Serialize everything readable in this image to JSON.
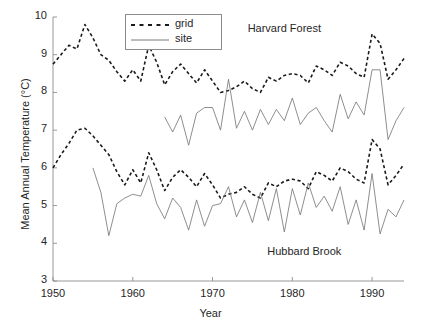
{
  "chart_data": {
    "type": "line",
    "title": "",
    "xlabel": "Year",
    "ylabel": "Mean Annual Temperature (°C)",
    "xlim": [
      1950,
      1994
    ],
    "ylim": [
      3,
      10
    ],
    "xticks": [
      1950,
      1960,
      1970,
      1980,
      1990
    ],
    "xtick_labels": [
      "1950",
      "1960",
      "1970",
      "1980",
      "1990"
    ],
    "yticks": [
      3,
      4,
      5,
      6,
      7,
      8,
      9,
      10
    ],
    "ytick_labels": [
      "3",
      "4",
      "5",
      "6",
      "7",
      "8",
      "9",
      "10"
    ],
    "grid": false,
    "legend": {
      "position": "top-center",
      "entries": [
        {
          "name": "grid",
          "style": "dashed",
          "color": "#1a1a1a"
        },
        {
          "name": "site",
          "style": "solid",
          "color": "#7a7a7a"
        }
      ]
    },
    "annotations": [
      {
        "text": "Harvard Forest",
        "x": 1979,
        "y": 9.65
      },
      {
        "text": "Hubbard Brook",
        "x": 1981.5,
        "y": 3.75
      }
    ],
    "series": [
      {
        "name": "Harvard Forest grid",
        "station": "Harvard Forest",
        "kind": "grid",
        "style": "dashed",
        "color": "#1a1a1a",
        "x": [
          1950,
          1951,
          1952,
          1953,
          1954,
          1955,
          1956,
          1957,
          1958,
          1959,
          1960,
          1961,
          1962,
          1963,
          1964,
          1965,
          1966,
          1967,
          1968,
          1969,
          1970,
          1971,
          1972,
          1973,
          1974,
          1975,
          1976,
          1977,
          1978,
          1979,
          1980,
          1981,
          1982,
          1983,
          1984,
          1985,
          1986,
          1987,
          1988,
          1989,
          1990,
          1991,
          1992,
          1993,
          1994
        ],
        "y": [
          8.75,
          9.0,
          9.25,
          9.15,
          9.8,
          9.45,
          9.0,
          8.85,
          8.55,
          8.3,
          8.6,
          8.3,
          9.25,
          8.8,
          8.2,
          8.55,
          8.75,
          8.5,
          8.25,
          8.6,
          8.3,
          8.0,
          8.05,
          8.15,
          8.3,
          8.1,
          8.0,
          8.4,
          8.3,
          8.45,
          8.5,
          8.45,
          8.25,
          8.7,
          8.6,
          8.45,
          8.8,
          8.7,
          8.5,
          8.4,
          9.55,
          9.3,
          8.35,
          8.6,
          8.9
        ]
      },
      {
        "name": "Harvard Forest site",
        "station": "Harvard Forest",
        "kind": "site",
        "style": "solid",
        "color": "#7a7a7a",
        "x": [
          1964,
          1965,
          1966,
          1967,
          1968,
          1969,
          1970,
          1971,
          1972,
          1973,
          1974,
          1975,
          1976,
          1977,
          1978,
          1979,
          1980,
          1981,
          1982,
          1983,
          1984,
          1985,
          1986,
          1987,
          1988,
          1989,
          1990,
          1991,
          1992,
          1993,
          1994
        ],
        "y": [
          7.35,
          6.95,
          7.4,
          6.6,
          7.45,
          7.6,
          7.6,
          7.0,
          8.35,
          7.05,
          7.5,
          7.0,
          7.55,
          7.15,
          7.55,
          7.25,
          7.85,
          7.15,
          7.45,
          7.6,
          7.25,
          6.95,
          7.95,
          7.3,
          7.75,
          7.4,
          8.6,
          8.6,
          6.75,
          7.25,
          7.6
        ]
      },
      {
        "name": "Hubbard Brook grid",
        "station": "Hubbard Brook",
        "kind": "grid",
        "style": "dashed",
        "color": "#1a1a1a",
        "x": [
          1950,
          1951,
          1952,
          1953,
          1954,
          1955,
          1956,
          1957,
          1958,
          1959,
          1960,
          1961,
          1962,
          1963,
          1964,
          1965,
          1966,
          1967,
          1968,
          1969,
          1970,
          1971,
          1972,
          1973,
          1974,
          1975,
          1976,
          1977,
          1978,
          1979,
          1980,
          1981,
          1982,
          1983,
          1984,
          1985,
          1986,
          1987,
          1988,
          1989,
          1990,
          1991,
          1992,
          1993,
          1994
        ],
        "y": [
          6.0,
          6.35,
          6.65,
          7.0,
          7.05,
          6.85,
          6.6,
          6.35,
          5.9,
          5.55,
          5.95,
          5.6,
          6.4,
          5.95,
          5.4,
          5.75,
          5.95,
          5.75,
          5.5,
          5.85,
          5.55,
          5.2,
          5.3,
          5.35,
          5.5,
          5.3,
          5.2,
          5.6,
          5.5,
          5.65,
          5.7,
          5.65,
          5.45,
          5.9,
          5.8,
          5.65,
          6.0,
          5.9,
          5.7,
          5.6,
          6.75,
          6.5,
          5.55,
          5.8,
          6.1
        ]
      },
      {
        "name": "Hubbard Brook site",
        "station": "Hubbard Brook",
        "kind": "site",
        "style": "solid",
        "color": "#7a7a7a",
        "x": [
          1955,
          1956,
          1957,
          1958,
          1959,
          1960,
          1961,
          1962,
          1963,
          1964,
          1965,
          1966,
          1967,
          1968,
          1969,
          1970,
          1971,
          1972,
          1973,
          1974,
          1975,
          1976,
          1977,
          1978,
          1979,
          1980,
          1981,
          1982,
          1983,
          1984,
          1985,
          1986,
          1987,
          1988,
          1989,
          1990,
          1991,
          1992,
          1993,
          1994
        ],
        "y": [
          6.0,
          5.35,
          4.2,
          5.05,
          5.2,
          5.3,
          5.25,
          5.8,
          5.05,
          4.65,
          5.2,
          4.95,
          4.35,
          5.15,
          4.45,
          5.0,
          5.05,
          5.5,
          4.7,
          5.15,
          4.55,
          5.35,
          4.6,
          5.45,
          4.3,
          5.45,
          4.75,
          5.6,
          4.95,
          5.25,
          4.85,
          5.5,
          4.5,
          5.15,
          4.35,
          5.85,
          4.25,
          4.9,
          4.7,
          5.15
        ]
      }
    ]
  }
}
